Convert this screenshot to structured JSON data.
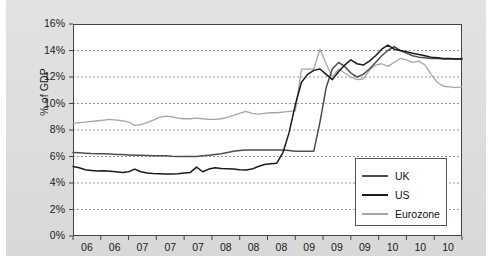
{
  "chart_data": {
    "type": "line",
    "title": "",
    "xlabel": "",
    "ylabel": "% of GDP",
    "ylim": [
      0,
      16
    ],
    "ytick_labels": [
      "0%",
      "2%",
      "4%",
      "6%",
      "8%",
      "10%",
      "12%",
      "14%",
      "16%"
    ],
    "ytick_values": [
      0,
      2,
      4,
      6,
      8,
      10,
      12,
      14,
      16
    ],
    "xtick_labels": [
      "06",
      "06",
      "07",
      "07",
      "07",
      "08",
      "08",
      "08",
      "09",
      "09",
      "09",
      "10",
      "10",
      "10"
    ],
    "grid": true,
    "legend_position": "bottom-right",
    "series": [
      {
        "name": "UK",
        "color": "#4d4d4d",
        "values": [
          6.3,
          6.28,
          6.25,
          6.22,
          6.2,
          6.2,
          6.18,
          6.15,
          6.15,
          6.12,
          6.1,
          6.1,
          6.08,
          6.05,
          6.05,
          6.05,
          6.02,
          6.0,
          6.0,
          6.0,
          6.0,
          6.05,
          6.1,
          6.15,
          6.2,
          6.3,
          6.4,
          6.45,
          6.5,
          6.5,
          6.5,
          6.5,
          6.5,
          6.5,
          6.5,
          6.45,
          6.4,
          6.4,
          6.4,
          6.4,
          8.6,
          11.2,
          12.6,
          13.1,
          12.8,
          12.3,
          12.0,
          12.2,
          12.6,
          13.1,
          13.6,
          14.0,
          14.3,
          14.0,
          13.8,
          13.6,
          13.5,
          13.45,
          13.4,
          13.4,
          13.35,
          13.35,
          13.35,
          13.4
        ]
      },
      {
        "name": "US",
        "color": "#1a1a1a",
        "values": [
          5.25,
          5.15,
          5.0,
          4.95,
          4.9,
          4.92,
          4.88,
          4.85,
          4.8,
          4.85,
          5.05,
          4.85,
          4.75,
          4.72,
          4.7,
          4.68,
          4.68,
          4.7,
          4.75,
          4.8,
          5.2,
          4.85,
          5.05,
          5.15,
          5.1,
          5.08,
          5.05,
          5.0,
          4.98,
          5.05,
          5.25,
          5.4,
          5.45,
          5.5,
          6.3,
          7.8,
          9.9,
          11.6,
          12.2,
          12.5,
          12.6,
          12.2,
          11.8,
          12.4,
          12.9,
          13.3,
          13.0,
          12.9,
          13.2,
          13.6,
          14.1,
          14.4,
          14.1,
          14.0,
          13.9,
          13.8,
          13.7,
          13.6,
          13.5,
          13.45,
          13.4,
          13.4,
          13.35,
          13.35
        ]
      },
      {
        "name": "Eurozone",
        "color": "#a6a6a6",
        "values": [
          8.5,
          8.55,
          8.6,
          8.65,
          8.7,
          8.75,
          8.8,
          8.75,
          8.7,
          8.6,
          8.35,
          8.4,
          8.55,
          8.75,
          8.95,
          9.05,
          9.0,
          8.9,
          8.85,
          8.85,
          8.9,
          8.85,
          8.8,
          8.8,
          8.85,
          8.95,
          9.1,
          9.25,
          9.4,
          9.25,
          9.2,
          9.25,
          9.3,
          9.3,
          9.35,
          9.4,
          9.45,
          12.6,
          12.6,
          12.6,
          14.1,
          13.0,
          12.0,
          12.6,
          12.3,
          12.0,
          11.8,
          11.85,
          12.5,
          12.9,
          13.0,
          12.8,
          13.1,
          13.4,
          13.3,
          13.1,
          13.2,
          12.9,
          12.2,
          11.6,
          11.3,
          11.25,
          11.2,
          11.25
        ]
      }
    ]
  },
  "legend": {
    "items": [
      {
        "label": "UK"
      },
      {
        "label": "US"
      },
      {
        "label": "Eurozone"
      }
    ]
  },
  "axis": {
    "y_title": "% of GDP"
  },
  "colors": {
    "uk": "#4d4d4d",
    "us": "#1a1a1a",
    "eurozone": "#a6a6a6",
    "panel_background": "#dedede",
    "plot_background": "#ffffff",
    "gridline": "#9a9a9a",
    "axis": "#444444"
  }
}
